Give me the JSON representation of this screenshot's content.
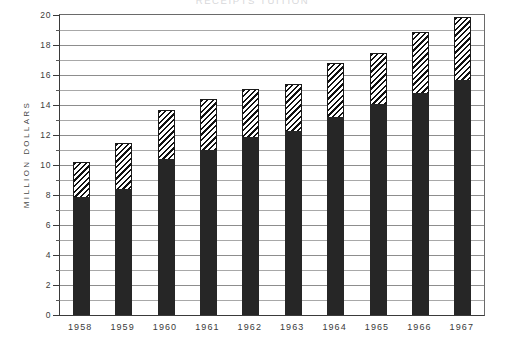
{
  "chart_data": {
    "type": "bar",
    "title": "RECEIPTS        TUITION",
    "xlabel": "",
    "ylabel": "MILLION DOLLARS",
    "ylim": [
      0,
      20
    ],
    "ytick_step": 2,
    "yticks": [
      "0",
      "2",
      "4",
      "6",
      "8",
      "10",
      "12",
      "14",
      "16",
      "18",
      "20"
    ],
    "minor_gridlines": true,
    "grid": true,
    "legend_position": "top",
    "stacked": true,
    "categories": [
      "1958",
      "1959",
      "1960",
      "1961",
      "1962",
      "1963",
      "1964",
      "1965",
      "1966",
      "1967"
    ],
    "series": [
      {
        "name": "solid-lower-segment",
        "style": "solid-black",
        "color": "#262626",
        "values": [
          7.9,
          8.4,
          10.4,
          11.0,
          11.9,
          12.3,
          13.2,
          14.1,
          14.8,
          15.7
        ]
      },
      {
        "name": "hatched-upper-segment",
        "style": "diagonal-hatch",
        "color": "#111111",
        "values": [
          2.3,
          3.1,
          3.3,
          3.4,
          3.2,
          3.1,
          3.6,
          3.4,
          4.1,
          4.2
        ]
      }
    ],
    "totals": [
      10.2,
      11.5,
      13.7,
      14.4,
      15.1,
      15.4,
      16.8,
      17.5,
      18.9,
      19.9
    ]
  }
}
